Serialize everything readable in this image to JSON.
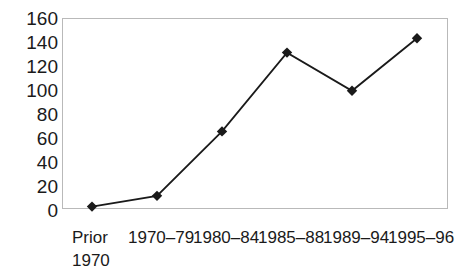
{
  "chart_data": {
    "type": "line",
    "title": "",
    "xlabel": "",
    "ylabel": "",
    "categories": [
      "Prior 1970",
      "1970–79",
      "1980–84",
      "1985–88",
      "1989–94",
      "1995–96"
    ],
    "values": [
      2,
      11,
      65,
      131,
      99,
      143
    ],
    "series": [
      {
        "name": "series-1",
        "values": [
          2,
          11,
          65,
          131,
          99,
          143
        ],
        "marker": "diamond",
        "color": "#1a1a1a"
      }
    ],
    "ylim": [
      0,
      160
    ],
    "ytick_labels": [
      "160",
      "140",
      "120",
      "100",
      "80",
      "60",
      "40",
      "20",
      "0"
    ],
    "ytick_values": [
      160,
      140,
      120,
      100,
      80,
      60,
      40,
      20,
      0
    ],
    "grid": false,
    "legend": "none",
    "frame_color": "#b9b9b9",
    "line_color": "#1a1a1a",
    "marker_color": "#1a1a1a",
    "background": "#ffffff"
  },
  "x_axis": {
    "ticks": [
      {
        "line1": "Prior",
        "line2": "1970"
      },
      {
        "line1": "1970–79",
        "line2": ""
      },
      {
        "line1": "1980–84",
        "line2": ""
      },
      {
        "line1": "1985–88",
        "line2": ""
      },
      {
        "line1": "1989–94",
        "line2": ""
      },
      {
        "line1": "1995–96",
        "line2": ""
      }
    ]
  }
}
